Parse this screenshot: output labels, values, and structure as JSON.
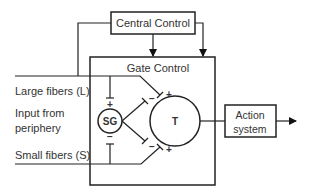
{
  "diagram": {
    "central_control": {
      "label": "Central Control"
    },
    "gate_control": {
      "label": "Gate Control"
    },
    "inputs": {
      "large_fibers": "Large fibers (L)",
      "input_line1": "Input from",
      "input_line2": "periphery",
      "small_fibers": "Small fibers (S)"
    },
    "nodes": {
      "sg": "SG",
      "t": "T"
    },
    "action_system": {
      "line1": "Action",
      "line2": "system"
    },
    "signs": {
      "plus": "+",
      "minus": "−"
    }
  }
}
